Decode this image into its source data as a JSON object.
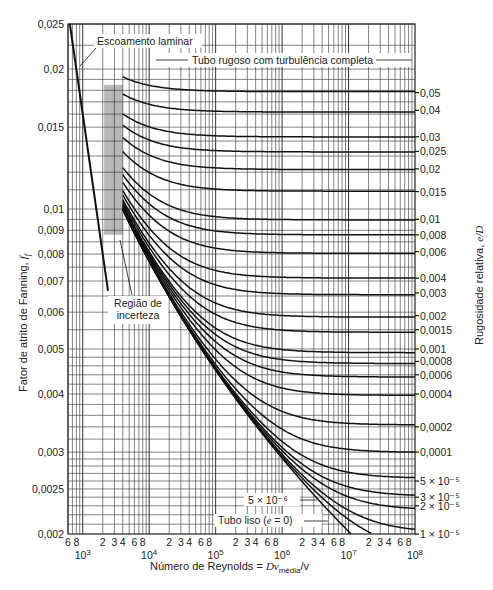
{
  "chart_data": {
    "type": "line",
    "title": "",
    "xlabel": "Número de Reynolds = Dv_média/v",
    "xlabel_parts": {
      "main": "Número de Reynolds = ",
      "var": "Dv",
      "sub": "média",
      "tail": "/v"
    },
    "ylabel": "Fator de atrito de Fanning, f_f",
    "ylabel_parts": {
      "main": "Fator de atrito de Fanning, ",
      "var": "f",
      "sub": "f"
    },
    "right_label": "Rugosidade relativa, e/D",
    "right_label_parts": {
      "main": "Rugosidade relativa, ",
      "var": "e/D"
    },
    "xscale": "log",
    "yscale": "log",
    "xlim": [
      600,
      100000000
    ],
    "ylim": [
      0.002,
      0.025
    ],
    "grid": true,
    "y_ticks": [
      "0,025",
      "0,02",
      "0,015",
      "0,01",
      "0,009",
      "0,008",
      "0,007",
      "0,006",
      "0,005",
      "0,004",
      "0,003",
      "0,0025",
      "0,002"
    ],
    "y_tick_values": [
      0.025,
      0.02,
      0.015,
      0.01,
      0.009,
      0.008,
      0.007,
      0.006,
      0.005,
      0.004,
      0.003,
      0.0025,
      0.002
    ],
    "x_decade_labels": [
      {
        "value": 1000,
        "base": "10",
        "exp": "3"
      },
      {
        "value": 10000,
        "base": "10",
        "exp": "4"
      },
      {
        "value": 100000,
        "base": "10",
        "exp": "5"
      },
      {
        "value": 1000000,
        "base": "10",
        "exp": "6"
      },
      {
        "value": 10000000,
        "base": "10",
        "exp": "7"
      },
      {
        "value": 100000000,
        "base": "10",
        "exp": "8"
      }
    ],
    "x_minor_labels": [
      "2",
      "3",
      "4",
      "6",
      "8"
    ],
    "roughness_labels": [
      {
        "label": "0,05",
        "value": 0.05,
        "f_rough": 0.0178
      },
      {
        "label": "0,04",
        "value": 0.04,
        "f_rough": 0.0163
      },
      {
        "label": "0,03",
        "value": 0.03,
        "f_rough": 0.0143
      },
      {
        "label": "0,025",
        "value": 0.025,
        "f_rough": 0.0133
      },
      {
        "label": "0,02",
        "value": 0.02,
        "f_rough": 0.0122
      },
      {
        "label": "0,015",
        "value": 0.015,
        "f_rough": 0.0109
      },
      {
        "label": "0,01",
        "value": 0.01,
        "f_rough": 0.0095
      },
      {
        "label": "0,008",
        "value": 0.008,
        "f_rough": 0.0088
      },
      {
        "label": "0,006",
        "value": 0.006,
        "f_rough": 0.0081
      },
      {
        "label": "0,004",
        "value": 0.004,
        "f_rough": 0.0071
      },
      {
        "label": "0,003",
        "value": 0.003,
        "f_rough": 0.0066
      },
      {
        "label": "0,002",
        "value": 0.002,
        "f_rough": 0.0059
      },
      {
        "label": "0,0015",
        "value": 0.0015,
        "f_rough": 0.0055
      },
      {
        "label": "0,001",
        "value": 0.001,
        "f_rough": 0.005
      },
      {
        "label": "0,0008",
        "value": 0.0008,
        "f_rough": 0.0047
      },
      {
        "label": "0,0006",
        "value": 0.0006,
        "f_rough": 0.0044
      },
      {
        "label": "0,0004",
        "value": 0.0004,
        "f_rough": 0.004
      },
      {
        "label": "0,0002",
        "value": 0.0002,
        "f_rough": 0.0034
      },
      {
        "label": "0,0001",
        "value": 0.0001,
        "f_rough": 0.003
      },
      {
        "label": "5 × 10⁻⁵",
        "value": 5e-05,
        "f_rough": 0.0026
      },
      {
        "label": "3 × 10⁻⁵",
        "value": 3e-05,
        "f_rough": 0.0024
      },
      {
        "label": "2 × 10⁻⁵",
        "value": 2e-05,
        "f_rough": 0.0023
      },
      {
        "label": "1 × 10⁻⁵",
        "value": 1e-05,
        "f_rough": 0.002
      }
    ],
    "series": [
      {
        "name": "Escoamento laminar",
        "formula": "f = 16/Re",
        "x": [
          640,
          3000
        ],
        "y": [
          0.025,
          0.0053
        ]
      },
      {
        "name": "Tubo liso (e = 0)",
        "formula": "Colebrook, e/D = 0"
      },
      {
        "name": "5 × 10⁻⁶",
        "value": 5e-06
      }
    ],
    "annotations": [
      {
        "text": "Escoamento laminar"
      },
      {
        "text": "Tubo rugoso com turbulência completa"
      },
      {
        "text_line1": "Região de",
        "text_line2": "incerteza"
      },
      {
        "text": "5 × 10⁻⁶"
      },
      {
        "text": "Tubo liso (e = 0)",
        "parts": {
          "pre": "Tubo liso (",
          "var": "e",
          "post": " = 0)"
        }
      }
    ],
    "uncertainty_region": {
      "x": [
        2100,
        4000
      ],
      "color": "#b8b8b8"
    }
  }
}
